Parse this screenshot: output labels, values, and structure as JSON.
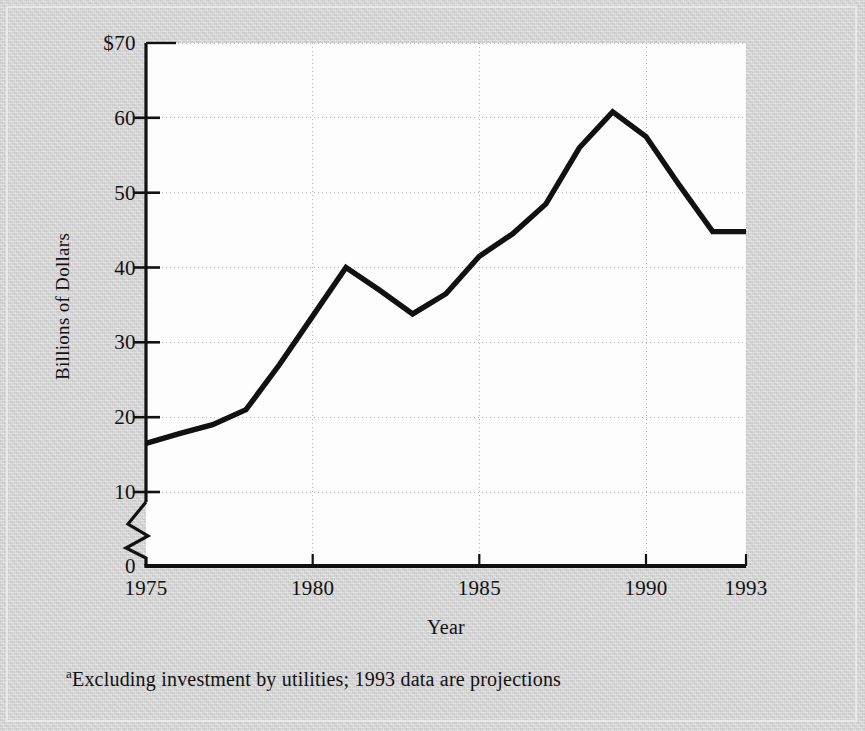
{
  "figure": {
    "y_axis_title": "Billions of Dollars",
    "x_axis_title": "Year",
    "footnote_marker": "a",
    "footnote_text": "Excluding investment by utilities; 1993 data are projections",
    "background_color": "#d3d3d3",
    "plot_background_color": "#fdfdfd",
    "line_color": "#111111",
    "grid_color": "#b9b9b9",
    "axis_color": "#111111"
  },
  "chart_data": {
    "type": "line",
    "title": "",
    "subtitle": "",
    "xlabel": "Year",
    "ylabel": "Billions of Dollars",
    "xlim": [
      1975,
      1993
    ],
    "ylim": [
      0,
      70
    ],
    "y_axis_broken": true,
    "y_axis_break_between": [
      0,
      10
    ],
    "grid": true,
    "legend": "none",
    "y_ticks": [
      0,
      10,
      20,
      30,
      40,
      50,
      60,
      70
    ],
    "y_tick_labels": [
      "0",
      "10",
      "20",
      "30",
      "40",
      "50",
      "60",
      "$70"
    ],
    "x_ticks": [
      1975,
      1980,
      1985,
      1990,
      1993
    ],
    "x_tick_labels": [
      "1975",
      "1980",
      "1985",
      "1990",
      "1993"
    ],
    "x": [
      1975,
      1976,
      1977,
      1978,
      1979,
      1980,
      1981,
      1982,
      1983,
      1984,
      1985,
      1986,
      1987,
      1988,
      1989,
      1990,
      1991,
      1992,
      1993
    ],
    "values": [
      16.5,
      17.8,
      19.0,
      21.0,
      27.0,
      33.5,
      40.0,
      37.0,
      33.8,
      36.5,
      41.5,
      44.5,
      48.5,
      56.0,
      60.8,
      57.5,
      51.0,
      44.8,
      44.8
    ],
    "series": [
      {
        "name": "Investment",
        "values": [
          16.5,
          17.8,
          19.0,
          21.0,
          27.0,
          33.5,
          40.0,
          37.0,
          33.8,
          36.5,
          41.5,
          44.5,
          48.5,
          56.0,
          60.8,
          57.5,
          51.0,
          44.8,
          44.8
        ]
      }
    ],
    "annotations": [
      "Excluding investment by utilities; 1993 data are projections"
    ]
  }
}
